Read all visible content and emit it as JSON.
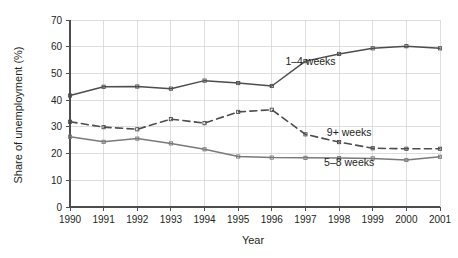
{
  "chart_data": {
    "type": "line",
    "title": "",
    "xlabel": "Year",
    "ylabel": "Share of unemployment (%)",
    "categories": [
      "1990",
      "1991",
      "1992",
      "1993",
      "1994",
      "1995",
      "1996",
      "1997",
      "1998",
      "1999",
      "2000",
      "2001"
    ],
    "x": [
      1990,
      1991,
      1992,
      1993,
      1994,
      1995,
      1996,
      1997,
      1998,
      1999,
      2000,
      2001
    ],
    "xlim": [
      1990,
      2001
    ],
    "ylim": [
      0,
      70
    ],
    "yticks": [
      0,
      10,
      20,
      30,
      40,
      50,
      60,
      70
    ],
    "grid": true,
    "legend_position": "inline-annotations",
    "series": [
      {
        "name": "1–4 weeks",
        "style": "solid",
        "color": "#4d4d4d",
        "label_x": 1997.15,
        "label_y": 53.0,
        "values": [
          41.7,
          45.0,
          45.1,
          44.3,
          47.3,
          46.4,
          45.3,
          54.6,
          57.3,
          59.4,
          60.2,
          59.4
        ]
      },
      {
        "name": "9+ weeks",
        "style": "dashed",
        "color": "#4d4d4d",
        "label_x": 1998.3,
        "label_y": 26.6,
        "values": [
          31.9,
          29.9,
          29.1,
          32.9,
          31.4,
          35.6,
          36.4,
          27.2,
          24.3,
          22.0,
          21.8,
          21.8
        ]
      },
      {
        "name": "5–8 weeks",
        "style": "solid",
        "color": "#7a7a7a",
        "label_x": 1998.3,
        "label_y": 15.2,
        "values": [
          26.3,
          24.4,
          25.6,
          23.8,
          21.6,
          18.9,
          18.5,
          18.4,
          18.3,
          18.2,
          17.6,
          18.8
        ]
      }
    ]
  }
}
